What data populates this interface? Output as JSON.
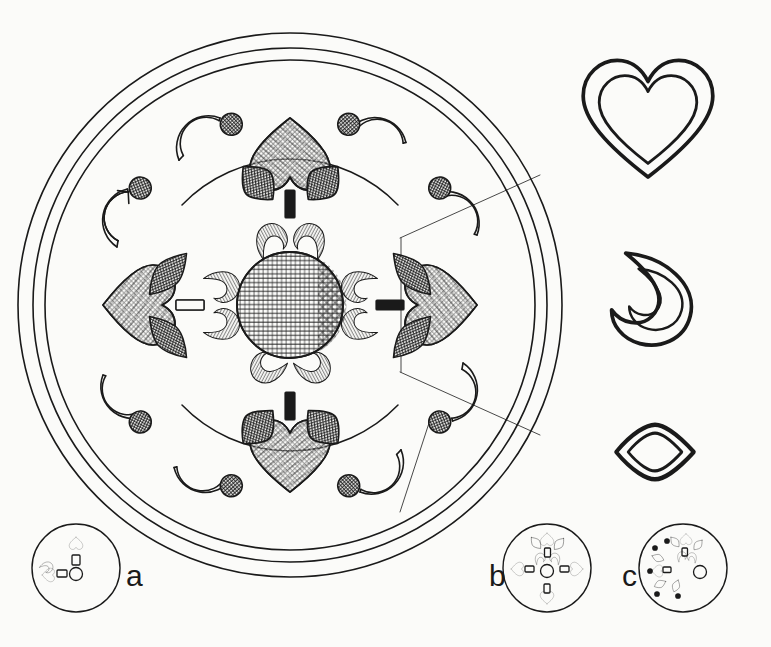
{
  "figure": {
    "kind": "archaeological-line-drawing",
    "background_color": "#fbfbf9",
    "ink_color": "#1a1a1a"
  },
  "main_disc": {
    "name": "ornamented-disc",
    "center_x": 290,
    "center_y": 305,
    "rings": [
      {
        "name": "outer-rim",
        "radius": 272
      },
      {
        "name": "inner-rim",
        "radius": 258
      },
      {
        "name": "field-edge",
        "radius": 246
      }
    ],
    "center_medallion": {
      "name": "central-hatched-disc",
      "radius": 53,
      "hatch": "cross-hatch"
    },
    "arcs": [
      {
        "name": "inner-bounding-arc-top",
        "radius": 150
      },
      {
        "name": "inner-bounding-arc-bottom",
        "radius": 150
      }
    ],
    "motifs": {
      "cardinal_hearts": {
        "count": 4,
        "hatch": "cross-hatch",
        "note": "large hearts at N, S, E, W pointing inward"
      },
      "dark_leaves": {
        "count": 8,
        "hatch": "dense-cross-hatch",
        "note": "paired dark leaves flanking each heart stem"
      },
      "heart_stems": {
        "count": 4,
        "fill": "solid-black",
        "shape": "small-rectangle"
      },
      "inner_commas": {
        "count": 8,
        "hatch": "horizontal-and-vertical-lines",
        "note": "paisley/comma petals around centre"
      },
      "c_hooks": {
        "count": 8,
        "note": "crescent C-shaped hooks in outer field"
      },
      "small_dots": {
        "count": 8,
        "hatch": "fine-cross-hatch",
        "note": "hatched studs beside each hook"
      }
    },
    "section_lines": {
      "name": "quadrant-section-lines",
      "count": 3,
      "note": "thin radial construction lines marking the right quadrant"
    }
  },
  "templates": [
    {
      "name": "heart-template",
      "label": "heart outline",
      "cx": 648,
      "cy": 128,
      "double_outline": true
    },
    {
      "name": "comma-template",
      "label": "comma / teardrop outline",
      "cx": 655,
      "cy": 300,
      "double_outline": true
    },
    {
      "name": "leaf-template",
      "label": "pointed-oval leaf outline",
      "cx": 655,
      "cy": 452,
      "double_outline": true
    }
  ],
  "schematics": [
    {
      "id": "a",
      "label": "a",
      "caption_x": 126,
      "caption_y": 561,
      "circle": {
        "cx": 76,
        "cy": 568,
        "r": 44
      },
      "elements": [
        {
          "name": "heart-north",
          "type": "heart",
          "x": 76,
          "y": 542
        },
        {
          "name": "bar-north",
          "type": "bar",
          "x": 76,
          "y": 558
        },
        {
          "name": "dot-centre",
          "type": "circle",
          "x": 76,
          "y": 574
        },
        {
          "name": "heart-west",
          "type": "heart",
          "x": 48,
          "y": 574
        },
        {
          "name": "comma-west",
          "type": "comma",
          "x": 46,
          "y": 568
        },
        {
          "name": "bar-west",
          "type": "bar",
          "x": 62,
          "y": 574
        }
      ]
    },
    {
      "id": "b",
      "label": "b",
      "caption_x": 489,
      "caption_y": 561,
      "circle": {
        "cx": 547,
        "cy": 568,
        "r": 44
      },
      "elements": [
        {
          "name": "heart-north",
          "type": "heart",
          "x": 547,
          "y": 538
        },
        {
          "name": "heart-south",
          "type": "heart",
          "x": 547,
          "y": 598
        },
        {
          "name": "heart-west",
          "type": "heart",
          "x": 517,
          "y": 568
        },
        {
          "name": "heart-east",
          "type": "heart",
          "x": 577,
          "y": 568
        },
        {
          "name": "dot-centre",
          "type": "circle",
          "x": 547,
          "y": 570
        },
        {
          "name": "leaf-pair",
          "type": "leaf",
          "count": 4
        },
        {
          "name": "comma-pair",
          "type": "comma",
          "count": 2
        },
        {
          "name": "bars",
          "type": "bar",
          "count": 4
        }
      ]
    },
    {
      "id": "c",
      "label": "c",
      "caption_x": 622,
      "caption_y": 561,
      "circle": {
        "cx": 683,
        "cy": 568,
        "r": 44
      },
      "elements": [
        {
          "name": "motif-cluster",
          "type": "cluster",
          "note": "quarter arrangement of hearts, leaves, commas"
        },
        {
          "name": "scatter-dots",
          "type": "dots",
          "count": 5
        },
        {
          "name": "dot-centre",
          "type": "circle",
          "x": 700,
          "y": 572
        }
      ]
    }
  ]
}
